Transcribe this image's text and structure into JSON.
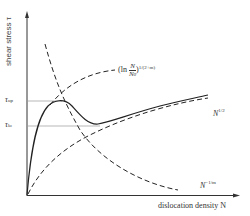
{
  "axes": {
    "y_label": "shear stress τ",
    "x_label": "dislocation density N"
  },
  "levels": {
    "upper": {
      "symbol": "τ",
      "sub": "up"
    },
    "lower": {
      "symbol": "τ",
      "sub": "lo"
    }
  },
  "curves": {
    "log_term": {
      "prefix": "(ln ",
      "num": "N",
      "den": "N",
      "den_sub": "0",
      "exp": "1/(2+m)"
    },
    "sqrt_term": {
      "base": "N",
      "exp": "1/2"
    },
    "power_term": {
      "base": "N",
      "exp": "−1/m"
    }
  },
  "colors": {
    "line": "#222222",
    "guide": "#999999"
  }
}
